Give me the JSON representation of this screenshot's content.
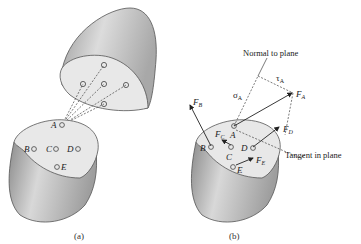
{
  "figure": {
    "panel_a": {
      "caption": "(a)",
      "points": [
        "A",
        "B",
        "C",
        "D",
        "E"
      ]
    },
    "panel_b": {
      "caption": "(b)",
      "points": [
        "A",
        "B",
        "C",
        "D",
        "E"
      ],
      "forces": [
        "F",
        "F",
        "F",
        "F",
        "F"
      ],
      "force_subscripts": [
        "A",
        "B",
        "C",
        "D",
        "E"
      ],
      "sigma": "σ",
      "sigma_sub": "A",
      "tau": "τ",
      "tau_sub": "A",
      "normal_label": "Normal to plane",
      "tangent_label": "Tangent in plane"
    }
  },
  "colors": {
    "surface_light": "#e8e8e8",
    "body_shade_dark": "#8a8a8a",
    "body_shade_light": "#d6d6d6",
    "outline": "#555555"
  }
}
